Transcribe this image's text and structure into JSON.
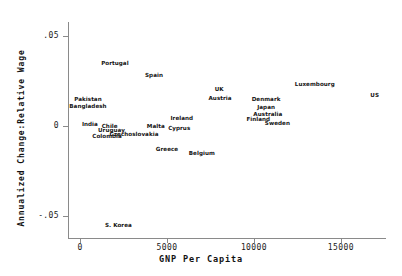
{
  "chart_data": {
    "type": "scatter",
    "title": "",
    "xlabel": "GNP Per Capita",
    "ylabel": "Annualized Change:Relative Wage",
    "xlim": [
      -700,
      17600
    ],
    "ylim": [
      -0.062,
      0.058
    ],
    "xticks": [
      0,
      5000,
      10000,
      15000
    ],
    "xticklabels": [
      "0",
      "5000",
      "10000",
      "15000"
    ],
    "yticks": [
      0.05,
      0,
      -0.05
    ],
    "yticklabels": [
      ".05",
      "0",
      "-.05"
    ],
    "grid": false,
    "legend": null,
    "marker": "text-label-only",
    "points": [
      {
        "label": "Portugal",
        "x": 2000,
        "y": 0.0355
      },
      {
        "label": "Spain",
        "x": 4250,
        "y": 0.0285
      },
      {
        "label": "UK",
        "x": 8000,
        "y": 0.021
      },
      {
        "label": "Luxembourg",
        "x": 13500,
        "y": 0.0235
      },
      {
        "label": "US",
        "x": 16950,
        "y": 0.0175
      },
      {
        "label": "Austria",
        "x": 8050,
        "y": 0.016
      },
      {
        "label": "Denmark",
        "x": 10700,
        "y": 0.0155
      },
      {
        "label": "Japan",
        "x": 10700,
        "y": 0.011
      },
      {
        "label": "Australia",
        "x": 10800,
        "y": 0.007
      },
      {
        "label": "Finland",
        "x": 10250,
        "y": 0.004
      },
      {
        "label": "Sweden",
        "x": 11350,
        "y": 0.002
      },
      {
        "label": "Pakistan",
        "x": 450,
        "y": 0.0155
      },
      {
        "label": "Bangladesh",
        "x": 450,
        "y": 0.0115
      },
      {
        "label": "Ireland",
        "x": 5850,
        "y": 0.0045
      },
      {
        "label": "Cyprus",
        "x": 5700,
        "y": -0.001
      },
      {
        "label": "Malta",
        "x": 4350,
        "y": 0.0005
      },
      {
        "label": "India",
        "x": 560,
        "y": 0.0015
      },
      {
        "label": "Chile",
        "x": 1700,
        "y": 0.0005
      },
      {
        "label": "Uruguay",
        "x": 1800,
        "y": -0.002
      },
      {
        "label": "Czechoslovakia",
        "x": 3100,
        "y": -0.004
      },
      {
        "label": "Colombia",
        "x": 1550,
        "y": -0.0055
      },
      {
        "label": "Greece",
        "x": 5000,
        "y": -0.0125
      },
      {
        "label": "Belgium",
        "x": 7000,
        "y": -0.0145
      },
      {
        "label": "S. Korea",
        "x": 2200,
        "y": -0.0545
      }
    ]
  },
  "axes": {
    "x_title": "GNP Per Capita",
    "y_title": "Annualized Change:Relative Wage",
    "x_tick_labels": [
      "0",
      "5000",
      "10000",
      "15000"
    ],
    "y_tick_labels": [
      ".05",
      "0",
      "-.05"
    ]
  },
  "colors": {
    "background": "#ffffff",
    "axis": "#8a8a8a",
    "text": "#141414"
  }
}
